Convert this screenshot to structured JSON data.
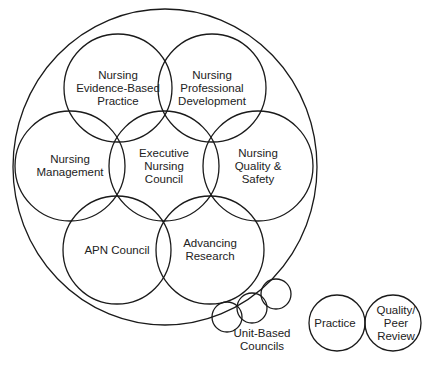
{
  "diagram": {
    "outer_ellipse": {
      "cx": 165,
      "cy": 167,
      "rx": 152,
      "ry": 158
    },
    "stroke_color": "#1a1a1a",
    "councils": [
      {
        "id": "evidence",
        "label": "Nursing\nEvidence-Based\nPractice",
        "cx": 118,
        "cy": 88,
        "r": 54
      },
      {
        "id": "professional",
        "label": "Nursing\nProfessional\nDevelopment",
        "cx": 212,
        "cy": 88,
        "r": 54
      },
      {
        "id": "management",
        "label": "Nursing\nManagement",
        "cx": 70,
        "cy": 166,
        "r": 55
      },
      {
        "id": "executive",
        "label": "Executive\nNursing\nCouncil",
        "cx": 164,
        "cy": 166,
        "r": 55
      },
      {
        "id": "quality",
        "label": "Nursing\nQuality &\nSafety",
        "cx": 258,
        "cy": 166,
        "r": 55
      },
      {
        "id": "apn",
        "label": "APN Council",
        "cx": 117,
        "cy": 250,
        "r": 54
      },
      {
        "id": "research",
        "label": "Advancing\nResearch",
        "cx": 210,
        "cy": 250,
        "r": 54
      }
    ],
    "unit_based": {
      "label": "Unit-Based\nCouncils",
      "circles": [
        {
          "cx": 227,
          "cy": 317,
          "r": 15
        },
        {
          "cx": 252,
          "cy": 308,
          "r": 15
        },
        {
          "cx": 276,
          "cy": 294,
          "r": 15
        }
      ]
    },
    "practice_pair": [
      {
        "id": "practice",
        "label": "Practice",
        "cx": 337,
        "cy": 323,
        "r": 28
      },
      {
        "id": "peer",
        "label": "Quality/\nPeer\nReview",
        "cx": 393,
        "cy": 323,
        "r": 28
      }
    ]
  }
}
